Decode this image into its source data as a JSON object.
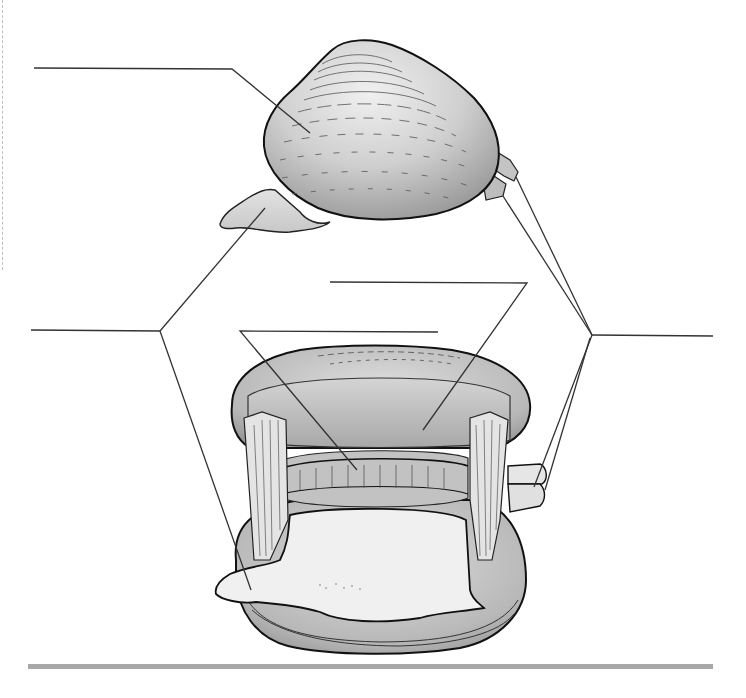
{
  "diagram": {
    "type": "labeling-worksheet",
    "views": [
      {
        "id": "external",
        "description": "closed clam, exterior side view with foot and siphons extended"
      },
      {
        "id": "internal",
        "description": "opened clam showing mantle, gills, adductor muscles, foot and siphons"
      }
    ],
    "labels": [
      {
        "id": "label-1",
        "text": "",
        "line": {
          "x1": 34,
          "y1": 68,
          "x2": 232,
          "y2": 69
        },
        "pointers": [
          {
            "x": 310,
            "y": 133
          }
        ]
      },
      {
        "id": "label-2",
        "text": "",
        "line": {
          "x1": 31,
          "y1": 330,
          "x2": 160,
          "y2": 331
        },
        "pointers": [
          {
            "x": 265,
            "y": 208
          },
          {
            "x": 251,
            "y": 590
          }
        ]
      },
      {
        "id": "label-3",
        "text": "",
        "line": {
          "x1": 330,
          "y1": 282,
          "x2": 527,
          "y2": 283
        },
        "pointers": [
          {
            "x": 423,
            "y": 430
          }
        ]
      },
      {
        "id": "label-4",
        "text": "",
        "line": {
          "x1": 240,
          "y1": 331,
          "x2": 438,
          "y2": 332
        },
        "pointers": [
          {
            "x": 357,
            "y": 470
          }
        ]
      },
      {
        "id": "label-5",
        "text": "",
        "line": {
          "x1": 592,
          "y1": 335,
          "x2": 713,
          "y2": 336
        },
        "pointers": [
          {
            "x": 516,
            "y": 177
          },
          {
            "x": 503,
            "y": 196
          },
          {
            "x": 534,
            "y": 487
          },
          {
            "x": 545,
            "y": 490
          }
        ]
      }
    ],
    "colors": {
      "line": "#333333",
      "outline": "#111111",
      "shell_light": "#e6e6e6",
      "shell_mid": "#bcbcbc",
      "shell_dark": "#8a8a8a",
      "flesh": "#eeeeee",
      "footer_bar": "#a8a8a8"
    }
  }
}
